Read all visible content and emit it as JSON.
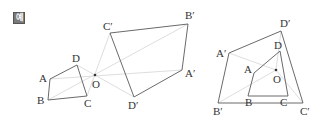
{
  "badge": {
    "label": "예",
    "bg": "#7a7a7a",
    "fg": "#ffffff"
  },
  "colors": {
    "edge": "#6a6a6a",
    "ray": "#dedede",
    "label": "#333333",
    "center": "#333333"
  },
  "figures": [
    {
      "name": "original",
      "center": {
        "label": "O",
        "x": 95,
        "y": 75
      },
      "vertices": [
        {
          "label": "A",
          "x": 50,
          "y": 79,
          "lx": 39,
          "ly": 82
        },
        {
          "label": "B",
          "x": 48,
          "y": 100,
          "lx": 37,
          "ly": 104
        },
        {
          "label": "C",
          "x": 87,
          "y": 96,
          "lx": 84,
          "ly": 107
        },
        {
          "label": "D",
          "x": 77,
          "y": 65,
          "lx": 72,
          "ly": 62
        }
      ]
    },
    {
      "name": "image-opposite",
      "vertices": [
        {
          "label": "A′",
          "x": 182,
          "y": 70,
          "lx": 185,
          "ly": 77
        },
        {
          "label": "B′",
          "x": 188,
          "y": 24,
          "lx": 185,
          "ly": 19
        },
        {
          "label": "C′",
          "x": 110,
          "y": 33,
          "lx": 103,
          "ly": 30
        },
        {
          "label": "D′",
          "x": 134,
          "y": 97,
          "lx": 128,
          "ly": 109
        }
      ]
    },
    {
      "name": "combined",
      "center": {
        "label": "O",
        "x": 276,
        "y": 70
      },
      "inner": [
        {
          "label": "A",
          "x": 254,
          "y": 73,
          "lx": 244,
          "ly": 73
        },
        {
          "label": "B",
          "x": 248,
          "y": 96,
          "lx": 245,
          "ly": 106
        },
        {
          "label": "C",
          "x": 288,
          "y": 96,
          "lx": 280,
          "ly": 106
        },
        {
          "label": "D",
          "x": 280,
          "y": 51,
          "lx": 274,
          "ly": 49
        }
      ],
      "outer": [
        {
          "label": "A′",
          "x": 229,
          "y": 53,
          "lx": 216,
          "ly": 57
        },
        {
          "label": "B′",
          "x": 218,
          "y": 103,
          "lx": 213,
          "ly": 115
        },
        {
          "label": "C′",
          "x": 303,
          "y": 103,
          "lx": 300,
          "ly": 115
        },
        {
          "label": "D′",
          "x": 281,
          "y": 31,
          "lx": 280,
          "ly": 27
        }
      ]
    }
  ]
}
